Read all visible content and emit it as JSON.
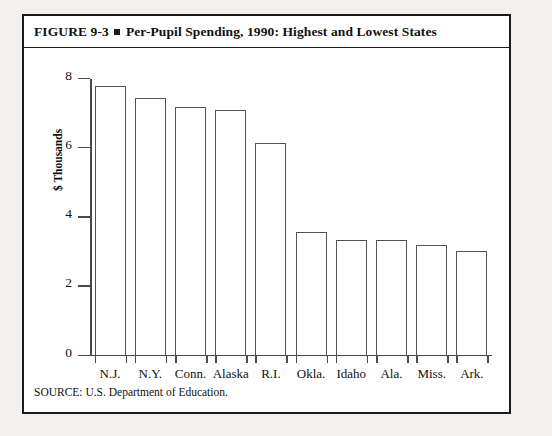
{
  "figure": {
    "title_prefix": "FIGURE 9-3",
    "title_text": "Per-Pupil Spending, 1990: Highest and Lowest States",
    "source": "SOURCE: U.S. Department of Education."
  },
  "chart_data": {
    "type": "bar",
    "title": "Per-Pupil Spending, 1990: Highest and Lowest States",
    "xlabel": "",
    "ylabel": "$ Thousands",
    "categories": [
      "N.J.",
      "N.Y.",
      "Conn.",
      "Alaska",
      "R.I.",
      "Okla.",
      "Idaho",
      "Ala.",
      "Miss.",
      "Ark."
    ],
    "values": [
      7.75,
      7.4,
      7.15,
      7.05,
      6.1,
      3.55,
      3.3,
      3.3,
      3.15,
      3.0
    ],
    "ylim": [
      0,
      8
    ],
    "yticks": [
      0,
      2,
      4,
      6,
      8
    ],
    "ytick_labels": [
      "0",
      "2",
      "4",
      "6",
      "8"
    ],
    "grid": false,
    "legend": false,
    "bar_face_color": "#ffffff",
    "bar_edge_color": "#555353",
    "axis_color": "#4a4a4a"
  }
}
